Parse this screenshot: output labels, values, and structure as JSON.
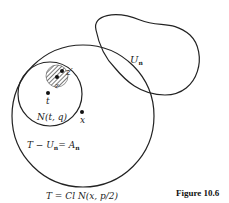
{
  "figure": {
    "caption": "Figure 10.6",
    "labels": {
      "z_prime": "z′",
      "z": "z",
      "t": "t",
      "x": "x",
      "neighborhood": "N(t, q)",
      "open_set": "U",
      "open_set_sub": "n",
      "difference_T": "T − U",
      "difference_sub": "n",
      "difference_eq": "= A",
      "difference_eq_sub": "n",
      "closure": "T = Cl N(x, p/2)"
    },
    "colors": {
      "stroke": "#222222",
      "hatch": "#333333",
      "background": "#ffffff"
    }
  }
}
